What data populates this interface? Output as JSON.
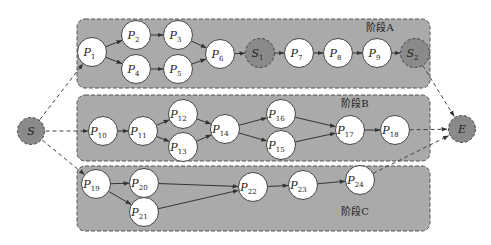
{
  "colors": {
    "panel": "#aaaaaa",
    "node": "#ffffff",
    "special_node": "#8a8a8a",
    "edge": "#333333"
  },
  "stages": [
    {
      "id": "A",
      "label": "阶段A",
      "x": 77,
      "y": 19,
      "w": 353,
      "h": 69,
      "label_x": 380,
      "label_y": 31
    },
    {
      "id": "B",
      "label": "阶段B",
      "x": 77,
      "y": 95,
      "w": 353,
      "h": 66,
      "label_x": 355,
      "label_y": 107
    },
    {
      "id": "C",
      "label": "阶段C",
      "x": 77,
      "y": 166,
      "w": 353,
      "h": 65,
      "label_x": 355,
      "label_y": 215
    }
  ],
  "nodes": [
    {
      "id": "S",
      "base": "S",
      "sub": "",
      "x": 31,
      "y": 131,
      "type": "special"
    },
    {
      "id": "E",
      "base": "E",
      "sub": "",
      "x": 462,
      "y": 129,
      "type": "special"
    },
    {
      "id": "P1",
      "base": "P",
      "sub": "1",
      "x": 92,
      "y": 52,
      "type": "normal"
    },
    {
      "id": "P2",
      "base": "P",
      "sub": "2",
      "x": 136,
      "y": 35,
      "type": "normal"
    },
    {
      "id": "P3",
      "base": "P",
      "sub": "3",
      "x": 178,
      "y": 35,
      "type": "normal"
    },
    {
      "id": "P4",
      "base": "P",
      "sub": "4",
      "x": 136,
      "y": 69,
      "type": "normal"
    },
    {
      "id": "P5",
      "base": "P",
      "sub": "5",
      "x": 178,
      "y": 69,
      "type": "normal"
    },
    {
      "id": "P6",
      "base": "P",
      "sub": "6",
      "x": 220,
      "y": 54,
      "type": "normal"
    },
    {
      "id": "S1",
      "base": "S",
      "sub": "1",
      "x": 260,
      "y": 53,
      "type": "special"
    },
    {
      "id": "P7",
      "base": "P",
      "sub": "7",
      "x": 299,
      "y": 53,
      "type": "normal"
    },
    {
      "id": "P8",
      "base": "P",
      "sub": "8",
      "x": 338,
      "y": 53,
      "type": "normal"
    },
    {
      "id": "P9",
      "base": "P",
      "sub": "9",
      "x": 377,
      "y": 53,
      "type": "normal"
    },
    {
      "id": "S2",
      "base": "S",
      "sub": "2",
      "x": 415,
      "y": 53,
      "type": "special"
    },
    {
      "id": "P10",
      "base": "P",
      "sub": "10",
      "x": 103,
      "y": 131,
      "type": "normal"
    },
    {
      "id": "P11",
      "base": "P",
      "sub": "11",
      "x": 143,
      "y": 131,
      "type": "normal"
    },
    {
      "id": "P12",
      "base": "P",
      "sub": "12",
      "x": 183,
      "y": 114,
      "type": "normal"
    },
    {
      "id": "P13",
      "base": "P",
      "sub": "13",
      "x": 183,
      "y": 147,
      "type": "normal"
    },
    {
      "id": "P14",
      "base": "P",
      "sub": "14",
      "x": 225,
      "y": 129,
      "type": "normal"
    },
    {
      "id": "P16",
      "base": "P",
      "sub": "16",
      "x": 281,
      "y": 114,
      "type": "normal"
    },
    {
      "id": "P15",
      "base": "P",
      "sub": "15",
      "x": 281,
      "y": 145,
      "type": "normal"
    },
    {
      "id": "P17",
      "base": "P",
      "sub": "17",
      "x": 350,
      "y": 130,
      "type": "normal"
    },
    {
      "id": "P18",
      "base": "P",
      "sub": "18",
      "x": 395,
      "y": 130,
      "type": "normal"
    },
    {
      "id": "P19",
      "base": "P",
      "sub": "19",
      "x": 96,
      "y": 184,
      "type": "normal"
    },
    {
      "id": "P20",
      "base": "P",
      "sub": "20",
      "x": 144,
      "y": 183,
      "type": "normal"
    },
    {
      "id": "P21",
      "base": "P",
      "sub": "21",
      "x": 144,
      "y": 212,
      "type": "normal"
    },
    {
      "id": "P22",
      "base": "P",
      "sub": "22",
      "x": 253,
      "y": 187,
      "type": "normal"
    },
    {
      "id": "P23",
      "base": "P",
      "sub": "23",
      "x": 303,
      "y": 185,
      "type": "normal"
    },
    {
      "id": "P24",
      "base": "P",
      "sub": "24",
      "x": 360,
      "y": 180,
      "type": "normal"
    }
  ],
  "edges": [
    {
      "from": "S",
      "to": "P1",
      "style": "dashed"
    },
    {
      "from": "S",
      "to": "P10",
      "style": "dashed"
    },
    {
      "from": "S",
      "to": "P19",
      "style": "dashed"
    },
    {
      "from": "P1",
      "to": "P2",
      "style": "solid"
    },
    {
      "from": "P1",
      "to": "P4",
      "style": "solid"
    },
    {
      "from": "P2",
      "to": "P3",
      "style": "solid"
    },
    {
      "from": "P4",
      "to": "P5",
      "style": "solid"
    },
    {
      "from": "P3",
      "to": "P6",
      "style": "solid"
    },
    {
      "from": "P5",
      "to": "P6",
      "style": "solid"
    },
    {
      "from": "P6",
      "to": "S1",
      "style": "solid"
    },
    {
      "from": "S1",
      "to": "P7",
      "style": "solid"
    },
    {
      "from": "P7",
      "to": "P8",
      "style": "solid"
    },
    {
      "from": "P8",
      "to": "P9",
      "style": "solid"
    },
    {
      "from": "P9",
      "to": "S2",
      "style": "solid"
    },
    {
      "from": "S2",
      "to": "E",
      "style": "dashed"
    },
    {
      "from": "P10",
      "to": "P11",
      "style": "solid"
    },
    {
      "from": "P11",
      "to": "P12",
      "style": "solid"
    },
    {
      "from": "P11",
      "to": "P13",
      "style": "solid"
    },
    {
      "from": "P12",
      "to": "P14",
      "style": "solid"
    },
    {
      "from": "P13",
      "to": "P14",
      "style": "solid"
    },
    {
      "from": "P14",
      "to": "P16",
      "style": "solid"
    },
    {
      "from": "P14",
      "to": "P15",
      "style": "solid"
    },
    {
      "from": "P16",
      "to": "P17",
      "style": "solid"
    },
    {
      "from": "P15",
      "to": "P17",
      "style": "solid"
    },
    {
      "from": "P17",
      "to": "P18",
      "style": "solid"
    },
    {
      "from": "P18",
      "to": "E",
      "style": "dashed"
    },
    {
      "from": "P19",
      "to": "P20",
      "style": "solid"
    },
    {
      "from": "P19",
      "to": "P21",
      "style": "solid"
    },
    {
      "from": "P20",
      "to": "P22",
      "style": "solid"
    },
    {
      "from": "P21",
      "to": "P22",
      "style": "solid"
    },
    {
      "from": "P22",
      "to": "P23",
      "style": "solid"
    },
    {
      "from": "P23",
      "to": "P24",
      "style": "solid"
    },
    {
      "from": "P24",
      "to": "E",
      "style": "dashed"
    }
  ]
}
